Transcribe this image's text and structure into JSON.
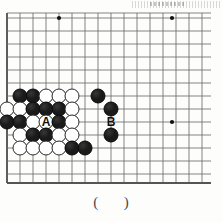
{
  "diagram": {
    "kind": "go-board-problem",
    "caption": "(    )",
    "board": {
      "line_color": "#6e6e6e",
      "edge_color": "#555555",
      "star_color": "#111111",
      "background": "#fdfdfc",
      "cell_size": 13,
      "origin_x": 7,
      "origin_y": 18,
      "cols": 17,
      "rows": 14,
      "left_edge_x": 7,
      "right_edge_x": 211,
      "top_line_y": 13,
      "bottom_edge_y": 183,
      "star_points": [
        {
          "x": 59,
          "y": 18
        },
        {
          "x": 172,
          "y": 18
        },
        {
          "x": 172,
          "y": 122
        }
      ]
    },
    "stone_colors": {
      "black": "#1a1a1a",
      "white": "#ffffff",
      "white_border": "#2a2a2a"
    },
    "stones": [
      {
        "color": "black",
        "x": 20,
        "y": 96
      },
      {
        "color": "black",
        "x": 33,
        "y": 96
      },
      {
        "color": "white",
        "x": 46,
        "y": 96
      },
      {
        "color": "white",
        "x": 59,
        "y": 96
      },
      {
        "color": "white",
        "x": 72,
        "y": 96
      },
      {
        "color": "black",
        "x": 98,
        "y": 96
      },
      {
        "color": "white",
        "x": 7,
        "y": 109
      },
      {
        "color": "white",
        "x": 20,
        "y": 109
      },
      {
        "color": "black",
        "x": 33,
        "y": 109
      },
      {
        "color": "black",
        "x": 46,
        "y": 109
      },
      {
        "color": "black",
        "x": 59,
        "y": 109
      },
      {
        "color": "white",
        "x": 72,
        "y": 109
      },
      {
        "color": "black",
        "x": 111,
        "y": 109
      },
      {
        "color": "black",
        "x": 7,
        "y": 122
      },
      {
        "color": "black",
        "x": 20,
        "y": 122
      },
      {
        "color": "white",
        "x": 33,
        "y": 122
      },
      {
        "color": "white",
        "x": 46,
        "y": 122
      },
      {
        "color": "black",
        "x": 59,
        "y": 122
      },
      {
        "color": "white",
        "x": 72,
        "y": 122
      },
      {
        "color": "white",
        "x": 20,
        "y": 135
      },
      {
        "color": "black",
        "x": 33,
        "y": 135
      },
      {
        "color": "black",
        "x": 46,
        "y": 135
      },
      {
        "color": "white",
        "x": 59,
        "y": 135
      },
      {
        "color": "white",
        "x": 72,
        "y": 135
      },
      {
        "color": "black",
        "x": 111,
        "y": 135
      },
      {
        "color": "white",
        "x": 20,
        "y": 148
      },
      {
        "color": "white",
        "x": 33,
        "y": 148
      },
      {
        "color": "white",
        "x": 46,
        "y": 148
      },
      {
        "color": "white",
        "x": 59,
        "y": 148
      },
      {
        "color": "black",
        "x": 72,
        "y": 148
      },
      {
        "color": "black",
        "x": 85,
        "y": 148
      }
    ],
    "labels": [
      {
        "text": "A",
        "x": 46,
        "y": 122
      },
      {
        "text": "B",
        "x": 111,
        "y": 122
      }
    ]
  }
}
